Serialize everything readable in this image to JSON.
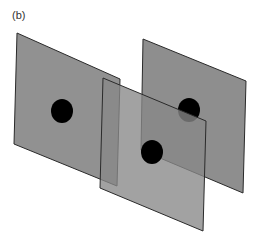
{
  "figure": {
    "panel_label": "(b)",
    "colors": {
      "plane_fill": "#888888",
      "plane_edge": "#2a2a2a",
      "dot": "#000000",
      "background": "#ffffff"
    },
    "planes": [
      {
        "id": "plane-back-right",
        "points": "143,39 246,81 243,193 141,150",
        "dot": {
          "cx": 189,
          "cy": 110,
          "rx": 11,
          "ry": 12
        }
      },
      {
        "id": "plane-left",
        "points": "17,33 120,79 117,186 14,144",
        "dot": {
          "cx": 62,
          "cy": 111,
          "rx": 11,
          "ry": 12
        }
      },
      {
        "id": "plane-front-center",
        "points": "103,78 206,121 203,231 100,188",
        "dot": {
          "cx": 152,
          "cy": 152,
          "rx": 11,
          "ry": 12
        }
      }
    ]
  }
}
